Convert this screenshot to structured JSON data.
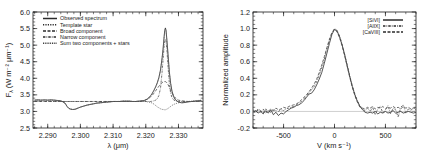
{
  "figure": {
    "panels": [
      {
        "id": "left",
        "axes": {
          "xlabel_main": "λ",
          "xlabel_unit": "(μm)",
          "ylabel": "F",
          "ylabel_sub": "λ",
          "ylabel_unit": "(W m⁻² μm⁻¹)",
          "xticks": [
            "2.290",
            "2.300",
            "2.310",
            "2.320",
            "2.330"
          ],
          "xtick_values": [
            2.29,
            2.3,
            2.31,
            2.32,
            2.33
          ],
          "yticks": [
            "2.5",
            "3.0",
            "3.5",
            "4.0",
            "4.5",
            "5.0",
            "5.5",
            "6.0"
          ],
          "ytick_values": [
            2.5,
            3.0,
            3.5,
            4.0,
            4.5,
            5.0,
            5.5,
            6.0
          ],
          "xlim": [
            2.2855,
            2.3375
          ],
          "ylim": [
            2.5,
            6.0
          ]
        },
        "legend": [
          {
            "label": "Observed spectrum",
            "style": "solid"
          },
          {
            "label": "Template star",
            "style": "dotted"
          },
          {
            "label": "Broad component",
            "style": "dashed"
          },
          {
            "label": "Narrow component",
            "style": "dash-dot"
          },
          {
            "label": "Sum two components + stars",
            "style": "fine-dotted"
          }
        ]
      },
      {
        "id": "right",
        "axes": {
          "xlabel_main": "V",
          "xlabel_unit": "(km s⁻¹)",
          "ylabel": "Normalized amplitude",
          "xticks": [
            "-500",
            "0",
            "500"
          ],
          "xtick_values": [
            -500,
            0,
            500
          ],
          "yticks": [
            "-0.2",
            "0.0",
            "0.2",
            "0.4",
            "0.6",
            "0.8",
            "1.0",
            "1.2"
          ],
          "ytick_values": [
            -0.2,
            0.0,
            0.2,
            0.4,
            0.6,
            0.8,
            1.0,
            1.2
          ],
          "xlim": [
            -800,
            800
          ],
          "ylim": [
            -0.2,
            1.2
          ]
        },
        "legend": [
          {
            "label": "[SiVI]",
            "style": "solid"
          },
          {
            "label": "[AlIX]",
            "style": "dash-dot"
          },
          {
            "label": "[CaVIII]",
            "style": "dashed"
          }
        ]
      }
    ]
  },
  "chart_data": [
    {
      "type": "line",
      "panel": "left",
      "title": "",
      "xlabel": "λ (μm)",
      "ylabel": "F_λ (W m⁻² μm⁻¹)",
      "xlim": [
        2.2855,
        2.3375
      ],
      "ylim": [
        2.5,
        6.0
      ],
      "grid": false,
      "legend_position": "top-left",
      "x": [
        2.286,
        2.287,
        2.288,
        2.289,
        2.29,
        2.291,
        2.292,
        2.293,
        2.294,
        2.295,
        2.2955,
        2.296,
        2.2965,
        2.297,
        2.2975,
        2.298,
        2.2985,
        2.299,
        2.2995,
        2.3,
        2.301,
        2.302,
        2.303,
        2.304,
        2.305,
        2.306,
        2.307,
        2.308,
        2.309,
        2.31,
        2.311,
        2.312,
        2.313,
        2.314,
        2.315,
        2.316,
        2.317,
        2.318,
        2.319,
        2.3195,
        2.32,
        2.3205,
        2.321,
        2.3215,
        2.322,
        2.3225,
        2.323,
        2.3235,
        2.324,
        2.3245,
        2.325,
        2.3253,
        2.3256,
        2.3258,
        2.326,
        2.3262,
        2.3265,
        2.3268,
        2.3272,
        2.3276,
        2.328,
        2.3285,
        2.329,
        2.33,
        2.331,
        2.332,
        2.333,
        2.334,
        2.335,
        2.336,
        2.337
      ],
      "series": [
        {
          "name": "Observed spectrum",
          "style": "solid",
          "values": [
            3.34,
            3.35,
            3.34,
            3.35,
            3.34,
            3.35,
            3.34,
            3.33,
            3.32,
            3.28,
            3.22,
            3.14,
            3.09,
            3.07,
            3.06,
            3.06,
            3.07,
            3.09,
            3.11,
            3.13,
            3.16,
            3.19,
            3.21,
            3.23,
            3.25,
            3.26,
            3.27,
            3.28,
            3.29,
            3.3,
            3.3,
            3.3,
            3.31,
            3.31,
            3.31,
            3.3,
            3.3,
            3.31,
            3.32,
            3.33,
            3.35,
            3.38,
            3.42,
            3.48,
            3.55,
            3.64,
            3.74,
            3.86,
            4.02,
            4.25,
            4.62,
            4.9,
            5.25,
            5.45,
            5.52,
            5.45,
            5.1,
            4.72,
            4.2,
            3.85,
            3.62,
            3.45,
            3.36,
            3.28,
            3.26,
            3.27,
            3.29,
            3.3,
            3.31,
            3.32,
            3.33
          ]
        },
        {
          "name": "Template star",
          "style": "dotted",
          "values": [
            3.34,
            3.34,
            3.34,
            3.34,
            3.34,
            3.34,
            3.34,
            3.33,
            3.31,
            3.27,
            3.21,
            3.14,
            3.09,
            3.07,
            3.06,
            3.06,
            3.07,
            3.09,
            3.11,
            3.13,
            3.16,
            3.19,
            3.21,
            3.23,
            3.25,
            3.26,
            3.27,
            3.28,
            3.29,
            3.3,
            3.3,
            3.3,
            3.31,
            3.31,
            3.31,
            3.3,
            3.3,
            3.3,
            3.3,
            3.3,
            3.3,
            3.29,
            3.28,
            3.27,
            3.25,
            3.22,
            3.18,
            3.14,
            3.11,
            3.08,
            3.06,
            3.06,
            3.05,
            3.05,
            3.05,
            3.06,
            3.07,
            3.09,
            3.12,
            3.15,
            3.18,
            3.21,
            3.23,
            3.26,
            3.28,
            3.29,
            3.3,
            3.31,
            3.32,
            3.33,
            3.34
          ]
        },
        {
          "name": "Broad component",
          "style": "dashed",
          "values": [
            3.3,
            3.3,
            3.3,
            3.3,
            3.3,
            3.3,
            3.3,
            3.3,
            3.3,
            3.3,
            3.3,
            3.3,
            3.3,
            3.3,
            3.3,
            3.3,
            3.3,
            3.3,
            3.3,
            3.3,
            3.3,
            3.3,
            3.3,
            3.3,
            3.3,
            3.3,
            3.3,
            3.3,
            3.3,
            3.3,
            3.3,
            3.3,
            3.3,
            3.3,
            3.3,
            3.3,
            3.3,
            3.31,
            3.32,
            3.33,
            3.35,
            3.37,
            3.4,
            3.44,
            3.49,
            3.55,
            3.62,
            3.69,
            3.76,
            3.82,
            3.87,
            3.89,
            3.9,
            3.9,
            3.9,
            3.89,
            3.86,
            3.81,
            3.73,
            3.64,
            3.56,
            3.47,
            3.41,
            3.34,
            3.32,
            3.31,
            3.3,
            3.3,
            3.3,
            3.3,
            3.3
          ]
        },
        {
          "name": "Narrow component",
          "style": "dash-dot",
          "values": [
            3.3,
            3.3,
            3.3,
            3.3,
            3.3,
            3.3,
            3.3,
            3.3,
            3.3,
            3.3,
            3.3,
            3.3,
            3.3,
            3.3,
            3.3,
            3.3,
            3.3,
            3.3,
            3.3,
            3.3,
            3.3,
            3.3,
            3.3,
            3.3,
            3.3,
            3.3,
            3.3,
            3.3,
            3.3,
            3.3,
            3.3,
            3.3,
            3.3,
            3.3,
            3.3,
            3.3,
            3.3,
            3.3,
            3.3,
            3.3,
            3.3,
            3.3,
            3.3,
            3.3,
            3.31,
            3.32,
            3.34,
            3.38,
            3.48,
            3.7,
            4.2,
            4.58,
            4.95,
            5.12,
            5.18,
            5.12,
            4.8,
            4.35,
            3.85,
            3.55,
            3.42,
            3.35,
            3.32,
            3.3,
            3.3,
            3.3,
            3.3,
            3.3,
            3.3,
            3.3,
            3.3
          ]
        },
        {
          "name": "Sum two components + stars",
          "style": "fine-dotted",
          "values": [
            3.34,
            3.34,
            3.34,
            3.34,
            3.34,
            3.34,
            3.34,
            3.33,
            3.31,
            3.27,
            3.21,
            3.14,
            3.09,
            3.07,
            3.06,
            3.06,
            3.07,
            3.09,
            3.11,
            3.13,
            3.16,
            3.19,
            3.21,
            3.23,
            3.25,
            3.26,
            3.27,
            3.28,
            3.29,
            3.3,
            3.3,
            3.3,
            3.31,
            3.31,
            3.31,
            3.3,
            3.3,
            3.31,
            3.32,
            3.33,
            3.35,
            3.37,
            3.41,
            3.47,
            3.54,
            3.63,
            3.73,
            3.85,
            4.0,
            4.24,
            4.6,
            4.88,
            5.22,
            5.42,
            5.48,
            5.42,
            5.08,
            4.7,
            4.18,
            3.83,
            3.6,
            3.44,
            3.35,
            3.28,
            3.26,
            3.27,
            3.29,
            3.3,
            3.31,
            3.32,
            3.33
          ]
        }
      ]
    },
    {
      "type": "line",
      "panel": "right",
      "title": "",
      "xlabel": "V (km s⁻¹)",
      "ylabel": "Normalized amplitude",
      "xlim": [
        -800,
        800
      ],
      "ylim": [
        -0.2,
        1.2
      ],
      "grid": false,
      "legend_position": "top-right",
      "zero_line": 0.0,
      "x": [
        -800,
        -775,
        -750,
        -725,
        -700,
        -675,
        -650,
        -625,
        -600,
        -575,
        -550,
        -525,
        -500,
        -475,
        -450,
        -425,
        -400,
        -375,
        -350,
        -325,
        -300,
        -275,
        -250,
        -225,
        -200,
        -175,
        -150,
        -125,
        -100,
        -75,
        -50,
        -25,
        0,
        25,
        50,
        75,
        100,
        125,
        150,
        175,
        200,
        225,
        250,
        275,
        300,
        325,
        350,
        375,
        400,
        425,
        450,
        475,
        500,
        525,
        550,
        575,
        600,
        625,
        650,
        675,
        700,
        725,
        750,
        775,
        800
      ],
      "series": [
        {
          "name": "[SiVI]",
          "style": "solid",
          "values": [
            -0.01,
            0.01,
            -0.02,
            0.0,
            -0.03,
            0.01,
            -0.02,
            0.02,
            -0.04,
            -0.01,
            -0.05,
            -0.02,
            -0.03,
            0.0,
            0.02,
            0.04,
            0.05,
            0.07,
            0.08,
            0.1,
            0.13,
            0.17,
            0.21,
            0.22,
            0.26,
            0.32,
            0.39,
            0.47,
            0.58,
            0.7,
            0.82,
            0.93,
            0.99,
            0.97,
            0.9,
            0.8,
            0.68,
            0.55,
            0.42,
            0.3,
            0.2,
            0.12,
            0.06,
            0.02,
            -0.01,
            -0.02,
            -0.01,
            -0.02,
            0.0,
            -0.03,
            -0.01,
            -0.02,
            0.0,
            -0.02,
            -0.01,
            0.01,
            -0.02,
            -0.01,
            0.0,
            -0.02,
            -0.01,
            0.0,
            -0.01,
            -0.02,
            -0.01
          ]
        },
        {
          "name": "[AlIX]",
          "style": "dash-dot",
          "values": [
            0.0,
            -0.02,
            0.02,
            -0.01,
            0.03,
            -0.02,
            0.01,
            -0.01,
            0.02,
            0.01,
            0.0,
            0.02,
            0.01,
            0.03,
            0.04,
            0.05,
            0.06,
            0.08,
            0.1,
            0.12,
            0.15,
            0.19,
            0.23,
            0.26,
            0.3,
            0.36,
            0.44,
            0.53,
            0.63,
            0.75,
            0.86,
            0.95,
            1.0,
            0.98,
            0.91,
            0.81,
            0.69,
            0.56,
            0.43,
            0.31,
            0.21,
            0.13,
            0.07,
            0.03,
            0.01,
            0.04,
            0.0,
            0.05,
            -0.04,
            0.03,
            0.06,
            -0.02,
            0.02,
            0.07,
            -0.03,
            0.04,
            0.02,
            -0.07,
            0.05,
            0.08,
            -0.02,
            0.03,
            0.01,
            0.05,
            0.02
          ]
        },
        {
          "name": "[CaVIII]",
          "style": "dashed",
          "values": [
            0.02,
            -0.01,
            0.03,
            0.01,
            -0.02,
            0.03,
            0.0,
            0.03,
            0.01,
            0.04,
            0.02,
            0.03,
            0.05,
            0.04,
            0.06,
            0.07,
            0.08,
            0.09,
            0.11,
            0.14,
            0.17,
            0.2,
            0.24,
            0.28,
            0.33,
            0.39,
            0.47,
            0.56,
            0.66,
            0.77,
            0.87,
            0.95,
            0.99,
            0.96,
            0.89,
            0.79,
            0.67,
            0.54,
            0.41,
            0.29,
            0.19,
            0.11,
            0.05,
            0.04,
            0.03,
            0.05,
            0.04,
            0.06,
            0.03,
            0.05,
            0.04,
            0.06,
            0.03,
            0.05,
            0.04,
            0.06,
            0.04,
            0.05,
            0.03,
            0.06,
            0.04,
            0.05,
            0.03,
            0.04,
            0.05
          ]
        }
      ]
    }
  ]
}
